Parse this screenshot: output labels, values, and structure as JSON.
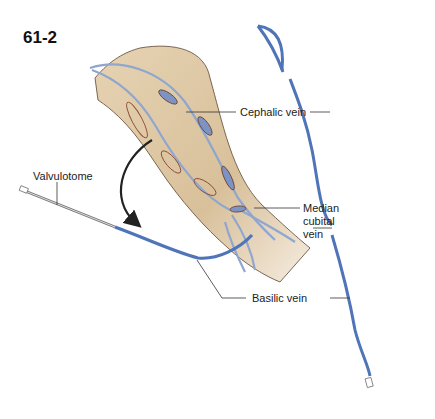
{
  "figure": {
    "id": "61-2"
  },
  "labels": {
    "valvulotome": "Valvulotome",
    "cephalic_vein": "Cephalic vein",
    "median_cubital_vein_line1": "Median",
    "median_cubital_vein_line2": "cubital",
    "median_cubital_vein_line3": "vein",
    "basilic_vein": "Basilic vein"
  },
  "colors": {
    "skin": "#d9c3a0",
    "skin_shadow": "#c4a97f",
    "vein": "#4f74b8",
    "vein_light": "#8fa6cf",
    "incision": "#8b4a35",
    "leader_line": "#333333",
    "arrow": "#222222"
  }
}
